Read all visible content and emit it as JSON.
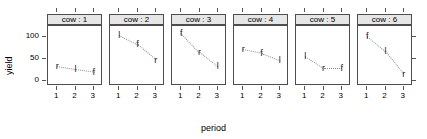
{
  "chart_data": {
    "type": "scatter",
    "title": "",
    "xlabel": "period",
    "ylabel": "yield",
    "xlim": [
      0.5,
      3.5
    ],
    "ylim": [
      -12,
      125
    ],
    "x": [
      1,
      2,
      3
    ],
    "xticklabels": [
      "1",
      "2",
      "3"
    ],
    "yticks": [
      0,
      50,
      100
    ],
    "yticklabels": [
      "0",
      "50",
      "100"
    ],
    "grid": false,
    "legend": null,
    "marker_style": "letter-glyph",
    "line_style": "dotted",
    "panel_variable": "cow",
    "panels": [
      {
        "strip": "cow : 1",
        "cow": 1,
        "points": [
          {
            "x": 1,
            "y": 33,
            "label": "r"
          },
          {
            "x": 2,
            "y": 26,
            "label": "l"
          },
          {
            "x": 3,
            "y": 20,
            "label": "f"
          }
        ]
      },
      {
        "strip": "cow : 2",
        "cow": 2,
        "points": [
          {
            "x": 1,
            "y": 104,
            "label": "l"
          },
          {
            "x": 2,
            "y": 83,
            "label": "f"
          },
          {
            "x": 3,
            "y": 48,
            "label": "r"
          }
        ]
      },
      {
        "strip": "cow : 3",
        "cow": 3,
        "points": [
          {
            "x": 1,
            "y": 110,
            "label": "f"
          },
          {
            "x": 2,
            "y": 66,
            "label": "r"
          },
          {
            "x": 3,
            "y": 33,
            "label": "l"
          }
        ]
      },
      {
        "strip": "cow : 4",
        "cow": 4,
        "points": [
          {
            "x": 1,
            "y": 72,
            "label": "r"
          },
          {
            "x": 2,
            "y": 64,
            "label": "f"
          },
          {
            "x": 3,
            "y": 47,
            "label": "l"
          }
        ]
      },
      {
        "strip": "cow : 5",
        "cow": 5,
        "points": [
          {
            "x": 1,
            "y": 56,
            "label": "l"
          },
          {
            "x": 2,
            "y": 29,
            "label": "r"
          },
          {
            "x": 3,
            "y": 29,
            "label": "f"
          }
        ]
      },
      {
        "strip": "cow : 6",
        "cow": 6,
        "points": [
          {
            "x": 1,
            "y": 102,
            "label": "f"
          },
          {
            "x": 2,
            "y": 68,
            "label": "l"
          },
          {
            "x": 3,
            "y": 16,
            "label": "r"
          }
        ]
      }
    ]
  },
  "colors": {
    "strip_background": "#e6e6e6",
    "border": "#4d4d4d",
    "marker": "#1a1a1a",
    "line": "#8c8c8c",
    "background": "#ffffff"
  }
}
